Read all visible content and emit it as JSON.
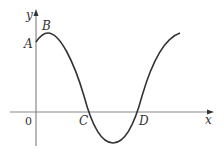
{
  "diagram": {
    "type": "sinusoidal-curve-graph",
    "axes": {
      "x_label": "x",
      "y_label": "y",
      "origin_label": "0"
    },
    "points": [
      {
        "label": "A",
        "description": "y-intercept of curve"
      },
      {
        "label": "B",
        "description": "local maximum"
      },
      {
        "label": "C",
        "description": "first x-intercept"
      },
      {
        "label": "D",
        "description": "second x-intercept"
      }
    ],
    "colors": {
      "axis": "#888888",
      "curve": "#333333",
      "text": "#333333"
    }
  }
}
